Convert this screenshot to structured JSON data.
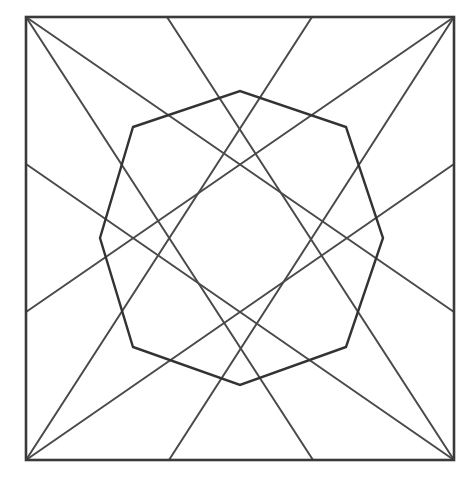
{
  "diagram": {
    "title": "",
    "canvas": {
      "width": 476,
      "height": 486,
      "background": "#ffffff"
    },
    "colors": {
      "square_stroke": "#3a3a3a",
      "line_stroke": "#4a4a4a",
      "octagon_stroke": "#333333"
    },
    "square": {
      "x1": 26,
      "y1": 17,
      "x2": 454,
      "y2": 460
    },
    "lines": [
      {
        "id": "tl-to-bottom",
        "from": [
          26,
          17
        ],
        "to": [
          313,
          460
        ]
      },
      {
        "id": "tl-to-right",
        "from": [
          26,
          17
        ],
        "to": [
          454,
          312
        ]
      },
      {
        "id": "tr-to-bottom",
        "from": [
          454,
          17
        ],
        "to": [
          169,
          460
        ]
      },
      {
        "id": "tr-to-left",
        "from": [
          454,
          17
        ],
        "to": [
          26,
          312
        ]
      },
      {
        "id": "bl-to-top",
        "from": [
          26,
          460
        ],
        "to": [
          312,
          17
        ]
      },
      {
        "id": "bl-to-right",
        "from": [
          26,
          460
        ],
        "to": [
          454,
          164
        ]
      },
      {
        "id": "br-to-top",
        "from": [
          454,
          460
        ],
        "to": [
          167,
          17
        ]
      },
      {
        "id": "br-to-left",
        "from": [
          454,
          460
        ],
        "to": [
          26,
          164
        ]
      }
    ],
    "octagon": {
      "points": [
        [
          133,
          127
        ],
        [
          240,
          91
        ],
        [
          346,
          127
        ],
        [
          383,
          238
        ],
        [
          346,
          347
        ],
        [
          240,
          385
        ],
        [
          133,
          347
        ],
        [
          100,
          238
        ]
      ]
    }
  }
}
